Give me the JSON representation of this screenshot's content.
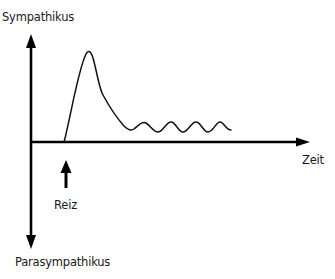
{
  "diagram": {
    "y_axis": {
      "top_label": "Sympathikus",
      "bottom_label": "Parasympathikus"
    },
    "x_axis": {
      "label": "Zeit"
    },
    "stimulus": {
      "label": "Reiz"
    },
    "curve": {
      "description": "Rapid rise after stimulus to a peak, decay, then damped oscillation above baseline",
      "color": "#111111"
    },
    "colors": {
      "axis": "#000000",
      "text": "#1a1a1a",
      "background": "#ffffff"
    }
  }
}
